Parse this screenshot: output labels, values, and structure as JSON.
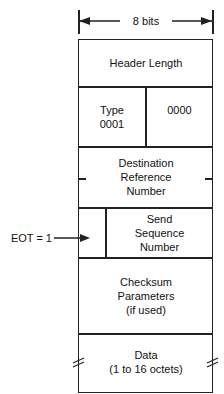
{
  "width_label": "8 bits",
  "fields": [
    {
      "label": "Header Length"
    },
    {
      "left": "Type\n0001",
      "right": "0000"
    },
    {
      "label": "Destination\nReference\nNumber"
    },
    {
      "label": "Send\nSequence\nNumber"
    },
    {
      "label": "Checksum\nParameters\n(if used)"
    },
    {
      "label": "Data\n(1 to 16 octets)"
    }
  ],
  "eot_label": "EOT = 1"
}
